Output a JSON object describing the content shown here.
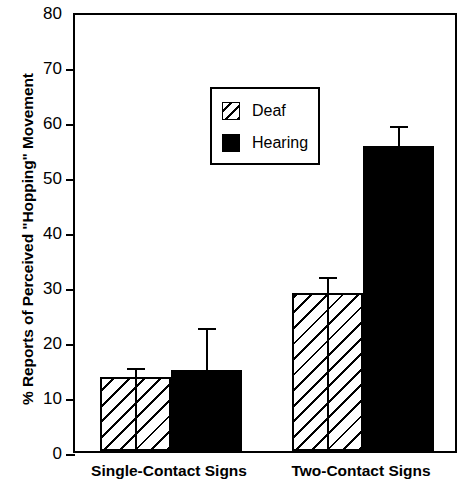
{
  "chart_data": {
    "type": "bar",
    "title": "",
    "xlabel": "",
    "ylabel": "% Reports of Perceived \"Hopping\" Movement",
    "ylim": [
      0,
      80
    ],
    "yticks": [
      0,
      10,
      20,
      30,
      40,
      50,
      60,
      70,
      80
    ],
    "ytick_labels": [
      "0",
      "10",
      "20",
      "30",
      "40",
      "50",
      "60",
      "70",
      "80"
    ],
    "grid": false,
    "legend_position": "upper-left-inside",
    "categories": [
      "Single-Contact Signs",
      "Two-Contact Signs"
    ],
    "series": [
      {
        "name": "Deaf",
        "fill": "hatched",
        "color": "#ffffff",
        "values": [
          13.5,
          28.7
        ],
        "errors": [
          1.3,
          2.5
        ]
      },
      {
        "name": "Hearing",
        "fill": "solid",
        "color": "#000000",
        "values": [
          14.8,
          55.5
        ],
        "errors": [
          7.2,
          3.3
        ]
      }
    ]
  },
  "legend": {
    "entries": [
      {
        "label": "Deaf",
        "swatch": "hatched-swatch"
      },
      {
        "label": "Hearing",
        "swatch": "solid-black-swatch"
      }
    ]
  },
  "axis": {
    "y_title": "% Reports of Perceived \"Hopping\" Movement",
    "y_max_label": "80",
    "y_min_label": "0"
  }
}
